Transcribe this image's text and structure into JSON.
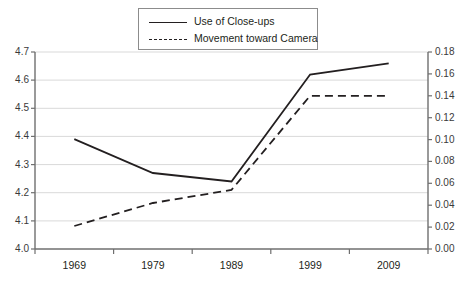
{
  "legend": {
    "items": [
      {
        "label": "Use of Close-ups",
        "style": "solid",
        "swatch_icon": "solid-line-icon"
      },
      {
        "label": "Movement toward Camera",
        "style": "dashed",
        "swatch_icon": "dashed-line-icon"
      }
    ]
  },
  "chart_data": {
    "type": "line",
    "title": "",
    "subtitle": "",
    "xlabel": "",
    "ylabel": "",
    "grid": true,
    "legend_position": "top-center",
    "categories": [
      "1969",
      "1979",
      "1989",
      "1999",
      "2009"
    ],
    "axes": {
      "x": {
        "tick_labels": [
          "1969",
          "1979",
          "1989",
          "1999",
          "2009"
        ],
        "labels_between_ticks": true
      },
      "y_left": {
        "label": "",
        "lim": [
          4.0,
          4.7
        ],
        "step": 0.1,
        "tick_labels": [
          "4.0",
          "4.1",
          "4.2",
          "4.3",
          "4.4",
          "4.5",
          "4.6",
          "4.7"
        ]
      },
      "y_right": {
        "label": "",
        "lim": [
          0.0,
          0.18
        ],
        "step": 0.02,
        "tick_labels": [
          "0.00",
          "0.02",
          "0.04",
          "0.06",
          "0.08",
          "0.10",
          "0.12",
          "0.14",
          "0.16",
          "0.18"
        ]
      }
    },
    "series": [
      {
        "name": "Use of Close-ups",
        "axis": "y_left",
        "style": "solid",
        "color": "#231f20",
        "values": [
          4.39,
          4.27,
          4.24,
          4.62,
          4.66
        ]
      },
      {
        "name": "Movement toward Camera",
        "axis": "y_right",
        "style": "dashed",
        "color": "#231f20",
        "values": [
          0.021,
          0.042,
          0.054,
          0.14,
          0.14
        ]
      }
    ]
  },
  "colors": {
    "line": "#231f20",
    "gridline": "#d9d9d9",
    "axis": "#6f6f6f",
    "background": "#ffffff",
    "legend_border": "#8c8c8c"
  }
}
